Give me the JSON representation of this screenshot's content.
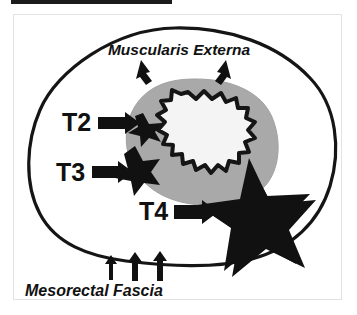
{
  "figure": {
    "type": "medical-diagram",
    "background_color": "#ffffff",
    "frame_color": "#e2e2e2",
    "top_rule_color": "#1b1b1b"
  },
  "anatomy": {
    "mesorectum_outline": {
      "name": "mesorectal-fascia-outline",
      "stroke_color": "#111111",
      "fill_color": "#ffffff"
    },
    "muscularis_externa": {
      "name": "muscularis-externa-ring",
      "fill_color": "#a9a9a9",
      "stroke_color": "#a9a9a9"
    },
    "lumen": {
      "name": "rectal-lumen",
      "fill_color": "#f4f4f4",
      "stroke_color": "#111111"
    }
  },
  "labels": {
    "muscularis_externa": "Muscularis Externa",
    "mesorectal_fascia": "Mesorectal Fascia",
    "t2": "T2",
    "t3": "T3",
    "t4": "T4"
  },
  "tumors": {
    "t2_star": {
      "name": "t2-tumor-star",
      "fill_color": "#111111",
      "description": "small star at inner lumen wall"
    },
    "t3_star": {
      "name": "t3-tumor-star",
      "fill_color": "#111111",
      "description": "medium star extending through muscularis externa into mesorectal fat"
    },
    "t4_star": {
      "name": "t4-tumor-star",
      "fill_color": "#111111",
      "description": "large star breaching the mesorectal fascia"
    }
  },
  "arrows": {
    "muscularis_left": "arrow-down-left",
    "muscularis_right": "arrow-down-right",
    "t2": "arrow-right",
    "t3": "arrow-right",
    "t4": "arrow-right",
    "fascia_1": "arrow-up",
    "fascia_2": "arrow-up",
    "fascia_3": "arrow-up",
    "color": "#111111"
  }
}
